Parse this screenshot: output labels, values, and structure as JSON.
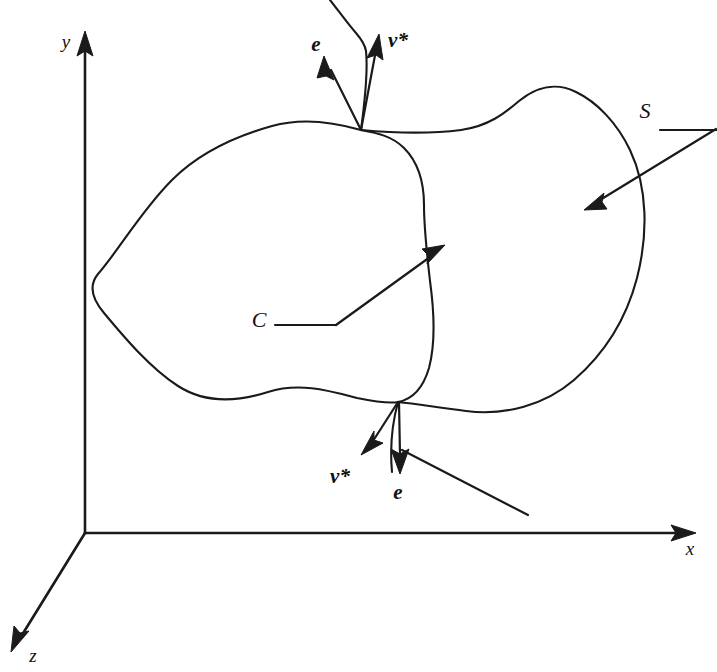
{
  "figure": {
    "background_color": "#ffffff",
    "ink_color": "#1a1a1a"
  },
  "axes": {
    "origin": {
      "x": 85,
      "y": 533
    },
    "items": [
      {
        "id": "y-axis",
        "label": "y",
        "label_x": 66,
        "label_y": 44,
        "x1": 85,
        "y1": 533,
        "x2": 85,
        "y2": 44,
        "arrow_angle_deg": -90
      },
      {
        "id": "x-axis",
        "label": "x",
        "label_x": 690,
        "label_y": 551,
        "x1": 85,
        "y1": 533,
        "x2": 694,
        "y2": 533,
        "arrow_angle_deg": 0
      },
      {
        "id": "z-axis",
        "label": "z",
        "label_x": 33,
        "label_y": 658,
        "x1": 85,
        "y1": 533,
        "x2": 13,
        "y2": 649,
        "arrow_angle_deg": 121.8
      }
    ]
  },
  "labels": {
    "surface": "S",
    "curve": "C",
    "vector_e_top": "e",
    "vector_nu_top": "ν*",
    "vector_nu_bottom": "ν*",
    "vector_e_bottom": "e"
  },
  "annotations": [
    {
      "id": "surface-label",
      "text": "S",
      "label_x": 645,
      "label_y": 113,
      "leader_path": "M 660 130 L 717 130",
      "arrow_path": "M 715 129 L 591 205",
      "arrow_tip": {
        "x": 586,
        "y": 208
      },
      "arrow_angle_deg": 148.5
    },
    {
      "id": "curve-label",
      "text": "C",
      "label_x": 259,
      "label_y": 322,
      "leader_path": "M 273 325 L 336 325",
      "arrow_path": "M 336 325 L 438 251",
      "arrow_tip": {
        "x": 443,
        "y": 247
      },
      "arrow_angle_deg": -36.0
    }
  ],
  "vectors": [
    {
      "id": "e-top",
      "text": "e",
      "label_x": 316,
      "label_y": 46,
      "origin": {
        "x": 361,
        "y": 130
      },
      "tip": {
        "x": 325,
        "y": 58
      },
      "arrow_angle_deg": -116.6
    },
    {
      "id": "nu-star-top",
      "text": "ν*",
      "label_x": 398,
      "label_y": 42,
      "origin": {
        "x": 361,
        "y": 130
      },
      "tip": {
        "x": 378,
        "y": 36
      },
      "arrow_angle_deg": -79.8
    },
    {
      "id": "nu-star-bottom",
      "text": "ν*",
      "label_x": 340,
      "label_y": 478,
      "origin": {
        "x": 398,
        "y": 402
      },
      "tip": {
        "x": 363,
        "y": 453
      },
      "arrow_angle_deg": 124.5
    },
    {
      "id": "e-bottom",
      "text": "e",
      "label_x": 398,
      "label_y": 494,
      "origin": {
        "x": 398,
        "y": 402
      },
      "tip": {
        "x": 400,
        "y": 470
      },
      "arrow_angle_deg": 88.3
    }
  ],
  "tangent_line": {
    "id": "tangent-line-bottom",
    "path": "M 402 450 L 528 515"
  },
  "curves": {
    "closed_curve_C": "M 361 130 C 330 121 300 118 272 126 C 240 135 200 152 172 180 C 141 211 119 250 98 274 C 88 286 93 300 104 313 C 124 337 150 368 178 386 C 206 404 240 401 268 392 C 300 382 330 391 357 398 C 372 401 388 404 398 402 C 414 399 424 385 429 368 C 436 342 434 310 430 281 C 427 255 424 228 424 205 C 424 183 418 162 404 148 C 392 136 377 133 361 130 Z",
    "surface_S_boundary": "M 330 0 C 338 10 348 24 356 33 C 362 40 365 45 366 51 C 368 70 365 100 361 130 C 394 133 430 134 461 130 C 489 126 505 113 519 101 C 536 87 556 82 576 92 C 597 102 617 123 630 150 C 648 188 648 235 637 278 C 626 320 604 354 574 380 C 545 405 505 416 466 411 C 440 408 418 404 398 402 C 392 424 390 450 392 472",
    "note": "the two strands pass through the intersection points (361,130) and (398,402)"
  }
}
